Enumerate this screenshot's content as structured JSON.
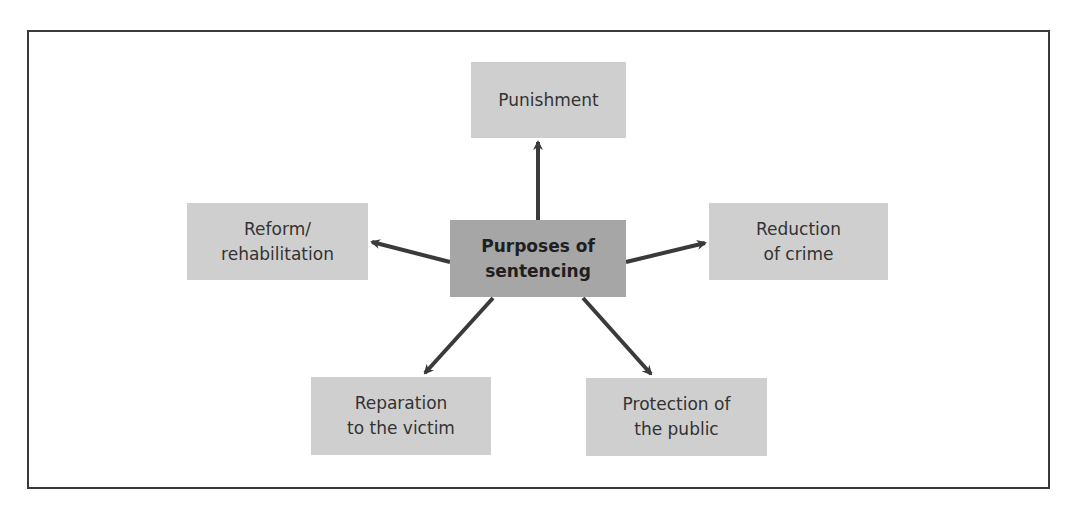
{
  "diagram": {
    "center": {
      "label": "Purposes of\nsentencing",
      "fill": "#a6a6a6"
    },
    "nodes": [
      {
        "id": "punishment",
        "label": "Punishment"
      },
      {
        "id": "reform",
        "label": "Reform/\nrehabilitation"
      },
      {
        "id": "reduction",
        "label": "Reduction\nof crime"
      },
      {
        "id": "reparation",
        "label": "Reparation\nto the victim"
      },
      {
        "id": "protection",
        "label": "Protection of\nthe public"
      }
    ],
    "node_fill": "#cfcfcf",
    "arrow_color": "#3a3a3a",
    "edges": [
      {
        "from": "center",
        "to": "punishment"
      },
      {
        "from": "center",
        "to": "reform"
      },
      {
        "from": "center",
        "to": "reduction"
      },
      {
        "from": "center",
        "to": "reparation"
      },
      {
        "from": "center",
        "to": "protection"
      }
    ]
  }
}
